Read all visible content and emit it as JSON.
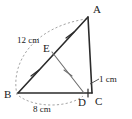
{
  "figure": {
    "kind": "geometry-diagram",
    "background_color": "#ffffff",
    "stroke_color": "#2b2b2b",
    "thin_stroke_color": "#6e6e6e",
    "dashed_color": "#9a9a9a"
  },
  "vertices": [
    {
      "id": "A",
      "label": "A",
      "x": 88,
      "y": 17,
      "label_x": 93,
      "label_y": 13
    },
    {
      "id": "B",
      "label": "B",
      "x": 18,
      "y": 93,
      "label_x": 4,
      "label_y": 98
    },
    {
      "id": "C",
      "label": "C",
      "x": 92,
      "y": 93,
      "label_x": 94,
      "label_y": 104
    },
    {
      "id": "D",
      "label": "D",
      "x": 84,
      "y": 93,
      "label_x": 78,
      "label_y": 105
    },
    {
      "id": "E",
      "label": "E",
      "x": 52,
      "y": 52,
      "label_x": 44,
      "label_y": 50
    }
  ],
  "edges": [
    {
      "id": "BA",
      "from": "B",
      "to": "A",
      "style": "solid",
      "ticks": 0
    },
    {
      "id": "AC",
      "from": "A",
      "to": "C",
      "style": "solid",
      "ticks": 0
    },
    {
      "id": "BC",
      "from": "B",
      "to": "C",
      "style": "solid",
      "ticks": 0
    },
    {
      "id": "ED",
      "from": "E",
      "to": "D",
      "style": "thin",
      "ticks": 1
    }
  ],
  "tick_marks": [
    {
      "id": "tick-on-BE",
      "on_segment": "BE",
      "count": 1,
      "x": 35,
      "y": 73
    },
    {
      "id": "tick-on-EA",
      "on_segment": "EA",
      "count": 1,
      "x": 70,
      "y": 35
    },
    {
      "id": "tick-on-ED",
      "on_segment": "ED",
      "count": 1,
      "x": 68,
      "y": 73
    },
    {
      "id": "tick-on-DC",
      "on_segment": "DC",
      "count": 1,
      "x": 88,
      "y": 93
    }
  ],
  "measurements": [
    {
      "id": "measure-BA",
      "text": "12 cm",
      "value": 12,
      "unit": "cm",
      "segment": "BA",
      "label_x": 20,
      "label_y": 42,
      "arc": "from B curving up to A"
    },
    {
      "id": "measure-BD",
      "text": "8 cm",
      "value": 8,
      "unit": "cm",
      "segment": "BD",
      "label_x": 38,
      "label_y": 112,
      "arc": "from B curving down to D"
    },
    {
      "id": "measure-DC",
      "text": "1 cm",
      "value": 1,
      "unit": "cm",
      "segment": "DC",
      "label_x": 101,
      "label_y": 82,
      "arc": "none"
    }
  ],
  "labels": {
    "vertex_a": "A",
    "vertex_b": "B",
    "vertex_c": "C",
    "vertex_d": "D",
    "vertex_e": "E",
    "length_ba": "12 cm",
    "length_bd": "8 cm",
    "length_dc": "1 cm"
  }
}
